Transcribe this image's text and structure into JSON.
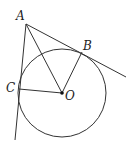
{
  "figure": {
    "type": "geometry",
    "colors": {
      "stroke": "#333333",
      "label": "#222222",
      "background": "#ffffff"
    },
    "points": {
      "A": {
        "label": "A",
        "x": 26,
        "y": 24
      },
      "B": {
        "label": "B",
        "x": 82,
        "y": 52
      },
      "C": {
        "label": "C",
        "x": 19,
        "y": 89
      },
      "O": {
        "label": "O",
        "x": 62,
        "y": 93
      }
    },
    "circle": {
      "center": "O",
      "radius": 44
    },
    "segments": [
      {
        "from": "A",
        "to": "O"
      },
      {
        "from": "O",
        "to": "B"
      },
      {
        "from": "O",
        "to": "C"
      }
    ],
    "lines": [
      {
        "name": "tangent AB",
        "through": [
          "A",
          "B"
        ],
        "extends_to": {
          "x": 126,
          "y": 77
        }
      },
      {
        "name": "tangent AC",
        "through": [
          "A",
          "C"
        ],
        "extends_to": {
          "x": 15,
          "y": 140
        }
      }
    ]
  }
}
